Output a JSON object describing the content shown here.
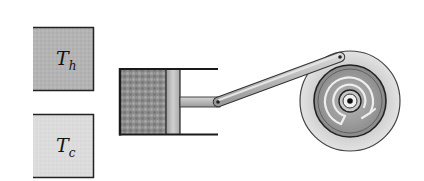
{
  "diagram": {
    "type": "heat-engine-schematic",
    "hot_reservoir": {
      "label_main": "T",
      "label_sub": "h",
      "color": "#b4b4b4"
    },
    "cold_reservoir": {
      "label_main": "T",
      "label_sub": "c",
      "color": "#dcdcdc"
    },
    "cylinder": {
      "gas_color": "#8c8c8c",
      "piston_color": "#bcbcbc"
    },
    "flywheel": {
      "outer_color": "#d2d2d2",
      "inner_color": "#9a9a9a",
      "rotation": "counterclockwise-arrow"
    }
  }
}
